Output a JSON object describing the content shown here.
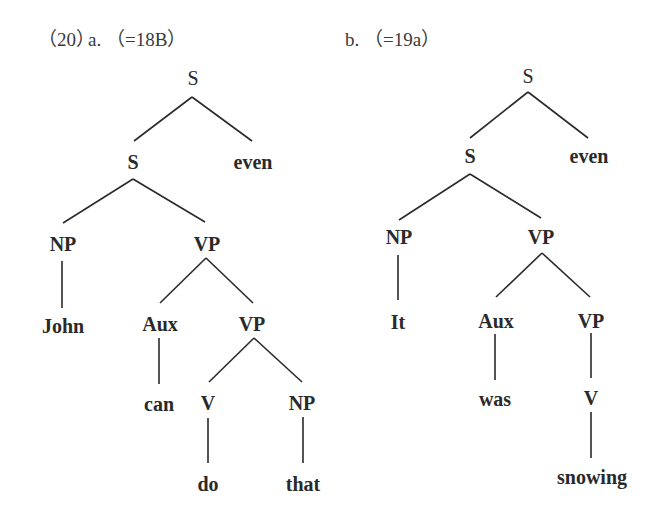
{
  "figure": {
    "example_number": "（20）",
    "trees": [
      {
        "id": "a",
        "caption": "a. （=18B）",
        "nodes": [
          {
            "id": "S0",
            "label": "S",
            "bold": false
          },
          {
            "id": "S1",
            "label": "S",
            "bold": true
          },
          {
            "id": "even",
            "label": "even",
            "bold": true
          },
          {
            "id": "NP1",
            "label": "NP",
            "bold": true
          },
          {
            "id": "VP1",
            "label": "VP",
            "bold": true
          },
          {
            "id": "John",
            "label": "John",
            "bold": true
          },
          {
            "id": "Aux",
            "label": "Aux",
            "bold": true
          },
          {
            "id": "VP2",
            "label": "VP",
            "bold": true
          },
          {
            "id": "can",
            "label": "can",
            "bold": true
          },
          {
            "id": "V",
            "label": "V",
            "bold": true
          },
          {
            "id": "NP2",
            "label": "NP",
            "bold": true
          },
          {
            "id": "do",
            "label": "do",
            "bold": true
          },
          {
            "id": "that",
            "label": "that",
            "bold": true
          }
        ],
        "edges": [
          [
            "S0",
            "S1"
          ],
          [
            "S0",
            "even"
          ],
          [
            "S1",
            "NP1"
          ],
          [
            "S1",
            "VP1"
          ],
          [
            "NP1",
            "John"
          ],
          [
            "VP1",
            "Aux"
          ],
          [
            "VP1",
            "VP2"
          ],
          [
            "Aux",
            "can"
          ],
          [
            "VP2",
            "V"
          ],
          [
            "VP2",
            "NP2"
          ],
          [
            "V",
            "do"
          ],
          [
            "NP2",
            "that"
          ]
        ]
      },
      {
        "id": "b",
        "caption": "b. （=19a）",
        "nodes": [
          {
            "id": "S0",
            "label": "S",
            "bold": false
          },
          {
            "id": "S1",
            "label": "S",
            "bold": true
          },
          {
            "id": "even",
            "label": "even",
            "bold": true
          },
          {
            "id": "NP1",
            "label": "NP",
            "bold": true
          },
          {
            "id": "VP1",
            "label": "VP",
            "bold": true
          },
          {
            "id": "It",
            "label": "It",
            "bold": true
          },
          {
            "id": "Aux",
            "label": "Aux",
            "bold": true
          },
          {
            "id": "VP2",
            "label": "VP",
            "bold": true
          },
          {
            "id": "was",
            "label": "was",
            "bold": true
          },
          {
            "id": "V",
            "label": "V",
            "bold": true
          },
          {
            "id": "snowing",
            "label": "snowing",
            "bold": true
          }
        ],
        "edges": [
          [
            "S0",
            "S1"
          ],
          [
            "S0",
            "even"
          ],
          [
            "S1",
            "NP1"
          ],
          [
            "S1",
            "VP1"
          ],
          [
            "NP1",
            "It"
          ],
          [
            "VP1",
            "Aux"
          ],
          [
            "VP1",
            "VP2"
          ],
          [
            "Aux",
            "was"
          ],
          [
            "VP2",
            "V"
          ],
          [
            "V",
            "snowing"
          ]
        ]
      }
    ]
  }
}
